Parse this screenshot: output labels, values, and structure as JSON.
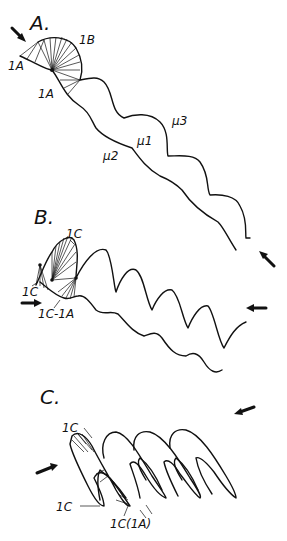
{
  "figure": {
    "panels": [
      {
        "id": "A",
        "label": "A.",
        "annotations": [
          "1A",
          "1B",
          "1A"
        ],
        "layer_labels": [
          "μ3",
          "μ1",
          "μ2"
        ]
      },
      {
        "id": "B",
        "label": "B.",
        "annotations": [
          "1C",
          "1C",
          "1C-1A"
        ]
      },
      {
        "id": "C",
        "label": "C.",
        "annotations": [
          "1C",
          "1C",
          "1C(1A)"
        ]
      }
    ]
  }
}
